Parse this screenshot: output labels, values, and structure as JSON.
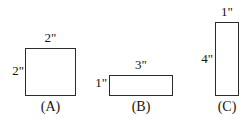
{
  "figure": {
    "background_color": "#ffffff",
    "stroke_color": "#2b2b2b",
    "text_color": "#141414"
  },
  "shapes": [
    {
      "id": "a",
      "caption": "(A)",
      "kind": "square",
      "width_label": "2\"",
      "height_label": "2\"",
      "width_inches": 2,
      "height_inches": 2
    },
    {
      "id": "b",
      "caption": "(B)",
      "kind": "rectangle",
      "width_label": "3\"",
      "height_label": "1\"",
      "width_inches": 3,
      "height_inches": 1
    },
    {
      "id": "c",
      "caption": "(C)",
      "kind": "rectangle",
      "width_label": "1\"",
      "height_label": "4\"",
      "width_inches": 1,
      "height_inches": 4
    }
  ]
}
